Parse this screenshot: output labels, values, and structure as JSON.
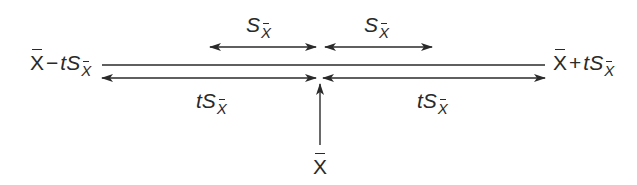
{
  "diagram": {
    "type": "confidence-interval-schematic",
    "stroke_color": "#2a2a2a",
    "left_bound": {
      "mean": "X",
      "op": "−",
      "coef": "t",
      "stat": "S",
      "sub": "X"
    },
    "right_bound": {
      "mean": "X",
      "op": "+",
      "coef": "t",
      "stat": "S",
      "sub": "X"
    },
    "upper_arrows": [
      {
        "stat": "S",
        "sub": "X",
        "description": "one standard error left of mean"
      },
      {
        "stat": "S",
        "sub": "X",
        "description": "one standard error right of mean"
      }
    ],
    "lower_arrows": [
      {
        "coef": "t",
        "stat": "S",
        "sub": "X",
        "description": "t standard errors left of mean"
      },
      {
        "coef": "t",
        "stat": "S",
        "sub": "X",
        "description": "t standard errors right of mean"
      }
    ],
    "center": {
      "mean": "X",
      "description": "sample mean"
    }
  }
}
